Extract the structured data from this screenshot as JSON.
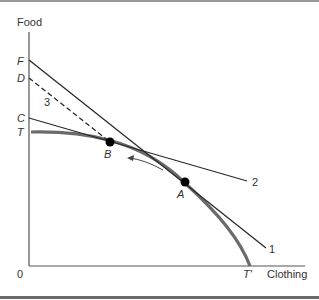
{
  "diagram": {
    "y_axis_label": "Food",
    "x_axis_label": "Clothing",
    "origin_label": "0",
    "y_intercepts": {
      "F": "F",
      "D": "D",
      "C": "C",
      "T": "T"
    },
    "x_intercept": "T'",
    "points": {
      "A": "A",
      "B": "B"
    },
    "line_labels": {
      "line1": "1",
      "line2": "2",
      "line3": "3"
    },
    "colors": {
      "curve": "#6b6b6b",
      "line": "#2a2a2a",
      "point": "#000000",
      "axis": "#555555"
    }
  }
}
